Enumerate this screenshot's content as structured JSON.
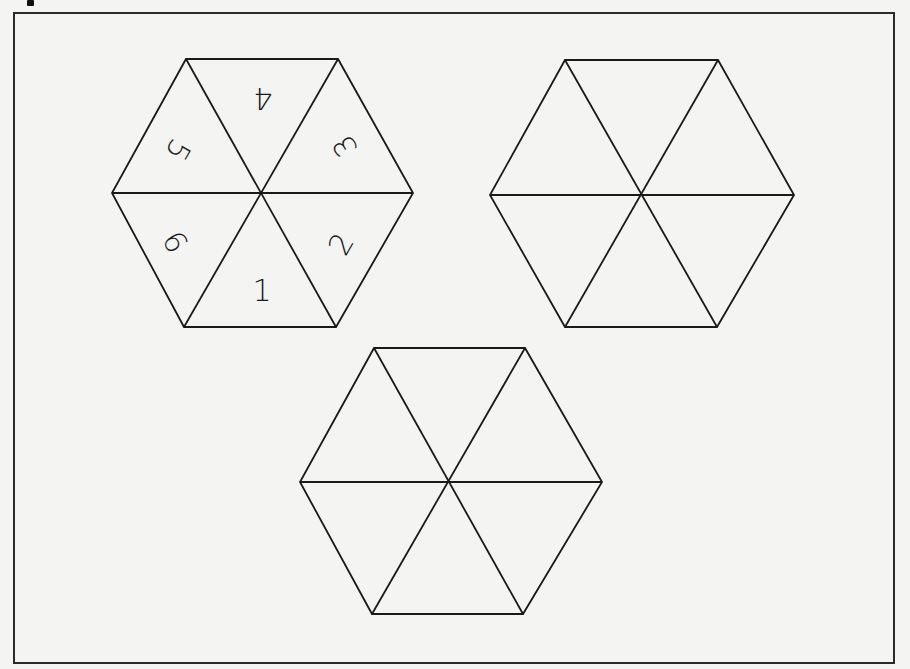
{
  "page": {
    "background": "#f4f4f2",
    "ink_color": "#1a1a1a",
    "frame": {
      "x": 14,
      "y": 13,
      "width": 880,
      "height": 650
    }
  },
  "spinners": [
    {
      "id": "spinner-labeled",
      "center": [
        262,
        194
      ],
      "vertices": [
        [
          186,
          59
        ],
        [
          338,
          59
        ],
        [
          413,
          193
        ],
        [
          336,
          327
        ],
        [
          184,
          327
        ],
        [
          112,
          193
        ]
      ],
      "labels": [
        {
          "text": "4",
          "x": 263,
          "y": 98,
          "rotate": 180
        },
        {
          "text": "3",
          "x": 345,
          "y": 146,
          "rotate": -120
        },
        {
          "text": "2",
          "x": 341,
          "y": 244,
          "rotate": -60
        },
        {
          "text": "1",
          "x": 262,
          "y": 290,
          "rotate": 0
        },
        {
          "text": "6",
          "x": 175,
          "y": 242,
          "rotate": 60
        },
        {
          "text": "5",
          "x": 178,
          "y": 150,
          "rotate": 120
        }
      ]
    },
    {
      "id": "spinner-blank-right",
      "center": [
        642,
        195
      ],
      "vertices": [
        [
          565,
          60
        ],
        [
          718,
          60
        ],
        [
          794,
          195
        ],
        [
          717,
          327
        ],
        [
          565,
          327
        ],
        [
          490,
          195
        ]
      ],
      "labels": []
    },
    {
      "id": "spinner-blank-bottom",
      "center": [
        449,
        482
      ],
      "vertices": [
        [
          374,
          348
        ],
        [
          525,
          348
        ],
        [
          602,
          482
        ],
        [
          523,
          614
        ],
        [
          372,
          614
        ],
        [
          300,
          482
        ]
      ],
      "labels": []
    }
  ]
}
